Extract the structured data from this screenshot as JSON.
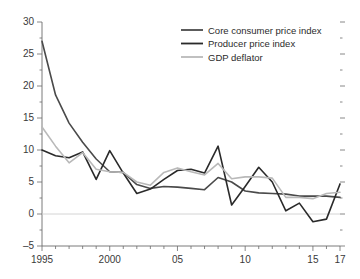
{
  "chart_data": {
    "type": "line",
    "title": "",
    "xlabel": "",
    "ylabel": "",
    "xlim": [
      1995,
      2017
    ],
    "ylim": [
      -5,
      30
    ],
    "ytick_step": 5,
    "yminor_step": 2.5,
    "grid": false,
    "zero_line": true,
    "legend_position": "top-right",
    "x": [
      1995,
      1996,
      1997,
      1998,
      1999,
      2000,
      2001,
      2002,
      2003,
      2004,
      2005,
      2006,
      2007,
      2008,
      2009,
      2010,
      2011,
      2012,
      2013,
      2014,
      2015,
      2016,
      2017
    ],
    "xtick_labels": [
      {
        "value": 1995,
        "label": "1995"
      },
      {
        "value": 2000,
        "label": "2000"
      },
      {
        "value": 2005,
        "label": "05"
      },
      {
        "value": 2010,
        "label": "10"
      },
      {
        "value": 2015,
        "label": "15"
      },
      {
        "value": 2017,
        "label": "17"
      }
    ],
    "ytick_labels": [
      {
        "value": 30,
        "label": "30"
      },
      {
        "value": 25,
        "label": "25"
      },
      {
        "value": 20,
        "label": "20"
      },
      {
        "value": 15,
        "label": "15"
      },
      {
        "value": 10,
        "label": "10"
      },
      {
        "value": 5,
        "label": "5"
      },
      {
        "value": 0,
        "label": "0"
      },
      {
        "value": -5,
        "label": "–5"
      }
    ],
    "series": [
      {
        "name": "Core consumer price index",
        "color": "#4a4a4a",
        "width": 1.6,
        "values": [
          27.0,
          18.6,
          14.2,
          11.2,
          8.6,
          6.6,
          6.5,
          4.6,
          4.0,
          4.3,
          4.2,
          4.0,
          3.8,
          5.7,
          5.0,
          3.6,
          3.3,
          3.2,
          3.1,
          2.8,
          2.8,
          2.8,
          2.6
        ]
      },
      {
        "name": "Producer price index",
        "color": "#2a2a2a",
        "width": 1.6,
        "values": [
          10.0,
          9.1,
          8.8,
          9.7,
          5.4,
          9.9,
          6.4,
          3.2,
          3.9,
          5.4,
          6.8,
          7.0,
          6.4,
          10.6,
          1.4,
          4.3,
          7.3,
          5.0,
          0.5,
          1.7,
          -1.2,
          -0.8,
          4.7
        ]
      },
      {
        "name": "GDP deflator",
        "color": "#b9b9b9",
        "width": 1.6,
        "values": [
          13.6,
          10.6,
          8.0,
          9.6,
          7.0,
          6.6,
          6.5,
          5.0,
          4.5,
          6.5,
          7.2,
          6.6,
          6.1,
          7.9,
          5.5,
          5.8,
          5.8,
          5.6,
          2.6,
          2.6,
          2.4,
          3.2,
          3.4
        ]
      }
    ]
  },
  "legend": {
    "items": [
      {
        "label": "Core consumer price index"
      },
      {
        "label": "Producer price index"
      },
      {
        "label": "GDP deflator"
      }
    ]
  }
}
